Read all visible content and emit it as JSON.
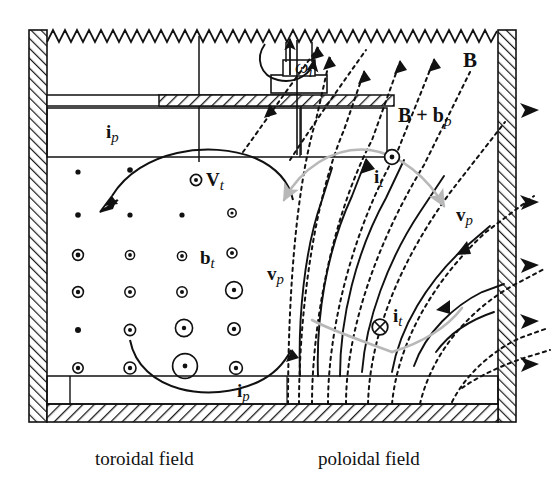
{
  "figure": {
    "type": "physics-schematic",
    "captions": {
      "left": "toroidal field",
      "right": "poloidal field"
    }
  },
  "labels": {
    "omega_i": {
      "text": "ω",
      "sub": "i",
      "name": "angular-velocity-label"
    },
    "i_p_top": {
      "text": "i",
      "sub": "p",
      "name": "poloidal-current-top-label"
    },
    "i_p_bottom": {
      "text": "i",
      "sub": "p",
      "name": "poloidal-current-bottom-label"
    },
    "V_t": {
      "marker": "⊙",
      "text": "V",
      "sub": "t",
      "name": "toroidal-velocity-label"
    },
    "b_t": {
      "text": "b",
      "sub": "t",
      "name": "toroidal-perturbation-field-label"
    },
    "B": {
      "text": "B",
      "name": "main-field-label"
    },
    "B_plus_b_p": {
      "text": "B + b",
      "sub": "p",
      "name": "perturbed-poloidal-field-label"
    },
    "i_t_upper": {
      "marker": "⊙",
      "text": "i",
      "sub": "t",
      "name": "toroidal-current-out-label"
    },
    "i_t_lower": {
      "marker": "⊗",
      "text": "i",
      "sub": "t",
      "name": "toroidal-current-in-label"
    },
    "v_p_left": {
      "text": "v",
      "sub": "p",
      "name": "poloidal-velocity-left-label"
    },
    "v_p_right": {
      "text": "v",
      "sub": "p",
      "name": "poloidal-velocity-right-label"
    }
  },
  "colors": {
    "ink": "#111111",
    "gray_arrow": "#b8b8b8",
    "hatch": "#1a1a1a",
    "background": "#ffffff"
  },
  "toroidal_dot_grid": {
    "description": "grid of circle-dot (out of page) markers increasing in size toward lower right",
    "columns_x": [
      78,
      130,
      182,
      232
    ],
    "rows_y": [
      172,
      215,
      255,
      292,
      330,
      368
    ],
    "radii": [
      [
        1.8,
        2.2,
        0.0,
        0.0
      ],
      [
        2.2,
        2.2,
        2.2,
        4.0
      ],
      [
        5.0,
        4.2,
        4.2,
        5.0
      ],
      [
        5.2,
        5.2,
        5.2,
        8.0
      ],
      [
        2.6,
        5.4,
        8.2,
        6.0
      ],
      [
        5.0,
        6.0,
        12.0,
        6.4
      ]
    ]
  },
  "walls": {
    "top_edge": "sawtooth",
    "left": "hatched",
    "right": "hatched",
    "bottom": "hatched"
  },
  "field_lines": {
    "dotted_count": 11,
    "solid_count": 7,
    "wall_exit_arrows": 5
  }
}
